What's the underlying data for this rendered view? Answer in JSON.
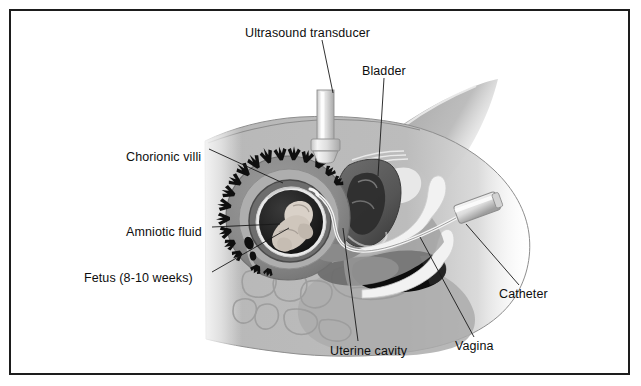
{
  "figure": {
    "width": 641,
    "height": 386,
    "background": "#ffffff",
    "frame_color": "#1d1d1d",
    "text_color": "#0e0e0e",
    "leader_color": "#1a1a1a"
  },
  "palette": {
    "body_tissue": "#b8b8b8",
    "body_tissue_light": "#c9c9c9",
    "body_tissue_dark": "#9a9a9a",
    "uterus_wall": "#8e8e8e",
    "uterus_wall_dark": "#6f6f6f",
    "decidua": "#a6a6a6",
    "amnion_dark": "#2f2f2f",
    "amniotic_fluid": "#1c1c1c",
    "fetus": "#d8d0c8",
    "villi": "#101010",
    "bladder": "#5f5f5f",
    "bladder_dark": "#444444",
    "rectum": "#0d0d0d",
    "instrument_white": "#f2f2f2",
    "instrument_gray": "#cfcfcf",
    "bone_outline": "#9f9f9f"
  },
  "labels": [
    {
      "id": "ultrasound-transducer",
      "text": "Ultrasound transducer",
      "x": 245,
      "y": 27,
      "anchor": "start",
      "leader": [
        [
          322,
          40
        ],
        [
          333,
          93
        ]
      ]
    },
    {
      "id": "bladder",
      "text": "Bladder",
      "x": 362,
      "y": 65,
      "anchor": "start",
      "leader": [
        [
          384,
          78
        ],
        [
          378,
          176
        ]
      ]
    },
    {
      "id": "chorionic-villi",
      "text": "Chorionic villi",
      "x": 128,
      "y": 152,
      "anchor": "start",
      "leader": [
        [
          209,
          159
        ],
        [
          283,
          183
        ]
      ]
    },
    {
      "id": "amniotic-fluid",
      "text": "Amniotic fluid",
      "x": 128,
      "y": 226,
      "anchor": "start",
      "leader": [
        [
          212,
          230
        ],
        [
          280,
          225
        ]
      ]
    },
    {
      "id": "fetus",
      "text": "Fetus (8-10 weeks)",
      "x": 86,
      "y": 277,
      "anchor": "start",
      "leader": [
        [
          212,
          275
        ],
        [
          288,
          228
        ]
      ]
    },
    {
      "id": "uterine-cavity",
      "text": "Uterine cavity",
      "x": 331,
      "y": 351,
      "anchor": "start",
      "leader": [
        [
          358,
          341
        ],
        [
          343,
          228
        ]
      ]
    },
    {
      "id": "vagina",
      "text": "Vagina",
      "x": 455,
      "y": 345,
      "anchor": "start",
      "leader": [
        [
          474,
          337
        ],
        [
          420,
          237
        ]
      ]
    },
    {
      "id": "catheter",
      "text": "Catheter",
      "x": 499,
      "y": 292,
      "anchor": "start",
      "leader": [
        [
          519,
          286
        ],
        [
          466,
          225
        ]
      ]
    }
  ],
  "anatomy": {
    "structures": [
      "maternal abdominal wall",
      "uterus",
      "chorionic villi ring",
      "amniotic sac",
      "fetus",
      "urinary bladder",
      "vaginal canal",
      "cervix",
      "rectum",
      "sacrum and coccyx vertebrae",
      "pubic bone"
    ],
    "instruments": [
      "ultrasound transducer probe",
      "transcervical sampling catheter"
    ]
  }
}
